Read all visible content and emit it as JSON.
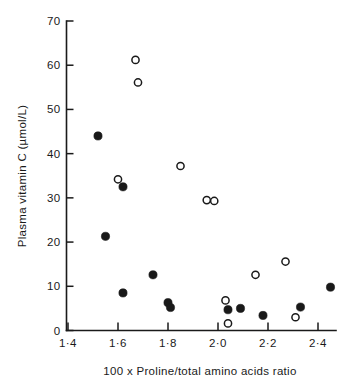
{
  "chart_data": {
    "type": "scatter",
    "title": "",
    "xlabel": "100 x Proline/total amino acids ratio",
    "ylabel": "Plasma vitamin C (µmol/L)",
    "xlim": [
      1.36,
      2.52
    ],
    "ylim": [
      0,
      70
    ],
    "grid": false,
    "legend_position": "none",
    "xticks": [
      1.4,
      1.6,
      1.8,
      2.0,
      2.2,
      2.4
    ],
    "xtick_labels": [
      "1·4",
      "1·6",
      "1·8",
      "2·0",
      "2·2",
      "2·4"
    ],
    "yticks": [
      0,
      10,
      20,
      30,
      40,
      50,
      60,
      70
    ],
    "ytick_labels": [
      "0",
      "10",
      "20",
      "30",
      "40",
      "50",
      "60",
      "70"
    ],
    "series": [
      {
        "name": "filled",
        "marker": "filled-circle",
        "color": "#191919",
        "points": [
          {
            "x": 1.52,
            "y": 44.0
          },
          {
            "x": 1.55,
            "y": 21.3
          },
          {
            "x": 1.62,
            "y": 32.5
          },
          {
            "x": 1.62,
            "y": 8.5
          },
          {
            "x": 1.74,
            "y": 12.6
          },
          {
            "x": 1.8,
            "y": 6.3
          },
          {
            "x": 1.81,
            "y": 5.2
          },
          {
            "x": 2.04,
            "y": 4.7
          },
          {
            "x": 2.09,
            "y": 5.0
          },
          {
            "x": 2.18,
            "y": 3.4
          },
          {
            "x": 2.33,
            "y": 5.3
          },
          {
            "x": 2.45,
            "y": 9.8
          }
        ]
      },
      {
        "name": "open",
        "marker": "open-circle",
        "color": "#191919",
        "points": [
          {
            "x": 1.6,
            "y": 34.2
          },
          {
            "x": 1.67,
            "y": 61.2
          },
          {
            "x": 1.68,
            "y": 56.1
          },
          {
            "x": 1.85,
            "y": 37.2
          },
          {
            "x": 1.955,
            "y": 29.5
          },
          {
            "x": 1.985,
            "y": 29.3
          },
          {
            "x": 2.03,
            "y": 6.8
          },
          {
            "x": 2.04,
            "y": 1.6
          },
          {
            "x": 2.15,
            "y": 12.6
          },
          {
            "x": 2.27,
            "y": 15.6
          },
          {
            "x": 2.31,
            "y": 3.0
          }
        ]
      }
    ]
  },
  "axes": {
    "y_title": "Plasma vitamin C (µmol/L)",
    "x_title": "100 x Proline/total amino acids ratio"
  }
}
